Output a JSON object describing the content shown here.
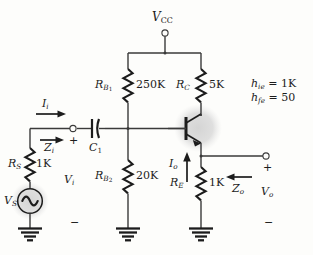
{
  "diagram": {
    "supply": {
      "name": "vcc-label",
      "symbol": "V",
      "subscript": "CC"
    },
    "components": [
      {
        "id": "rb1",
        "symbol": "R",
        "subscript": "B",
        "subscript2": "1",
        "value": "250K",
        "type": "resistor"
      },
      {
        "id": "rb2",
        "symbol": "R",
        "subscript": "B",
        "subscript2": "2",
        "value": "20K",
        "type": "resistor"
      },
      {
        "id": "rc",
        "symbol": "R",
        "subscript": "C",
        "subscript2": "",
        "value": "5K",
        "type": "resistor"
      },
      {
        "id": "re",
        "symbol": "R",
        "subscript": "E",
        "subscript2": "",
        "value": "1K",
        "type": "resistor"
      },
      {
        "id": "rs",
        "symbol": "R",
        "subscript": "S",
        "subscript2": "",
        "value": "1K",
        "type": "resistor"
      },
      {
        "id": "c1",
        "symbol": "C",
        "subscript": "1",
        "subscript2": "",
        "value": "",
        "type": "capacitor"
      },
      {
        "id": "vs",
        "symbol": "V",
        "subscript": "S",
        "subscript2": "",
        "value": "",
        "type": "ac-source"
      },
      {
        "id": "q1",
        "symbol": "",
        "subscript": "",
        "subscript2": "",
        "value": "",
        "type": "npn-transistor"
      }
    ],
    "signals": [
      {
        "id": "ii",
        "symbol": "I",
        "subscript": "i",
        "arrow": "right"
      },
      {
        "id": "zi",
        "symbol": "Z",
        "subscript": "i",
        "arrow": "right"
      },
      {
        "id": "io",
        "symbol": "I",
        "subscript": "o",
        "arrow": "up"
      },
      {
        "id": "zo",
        "symbol": "Z",
        "subscript": "o",
        "arrow": "left"
      },
      {
        "id": "vi",
        "symbol": "V",
        "subscript": "i",
        "arrow": "none"
      },
      {
        "id": "vo",
        "symbol": "V",
        "subscript": "o",
        "arrow": "none"
      }
    ],
    "polarity": {
      "vi_plus": "+",
      "vi_minus": "−",
      "vo_plus": "+",
      "vo_minus": "−"
    },
    "parameters": [
      {
        "symbol": "h",
        "subscript": "ie",
        "equals": "=",
        "value": "1K"
      },
      {
        "symbol": "h",
        "subscript": "fe",
        "equals": "=",
        "value": "50"
      }
    ],
    "grounds": [
      {
        "id": "gnd-source"
      },
      {
        "id": "gnd-rb2"
      },
      {
        "id": "gnd-re"
      }
    ],
    "colors": {
      "wire": "#3a3a3a",
      "ink": "#1c1c1c",
      "highlight": "#d8d8d8",
      "background": "#fdfdfb"
    }
  }
}
